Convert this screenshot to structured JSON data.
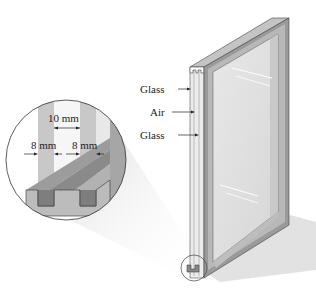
{
  "figure": {
    "labels": {
      "glass_top": "Glass",
      "air": "Air",
      "glass_bottom": "Glass",
      "gap": "10 mm",
      "pane_left": "8 mm",
      "pane_right": "8 mm"
    },
    "colors": {
      "frame_dark": "#7a7a7a",
      "frame_mid": "#a8a8a8",
      "frame_light": "#c8c8c8",
      "glass": "#e4e4e4",
      "shadow": "#d8d8d8",
      "outline": "#444444"
    }
  }
}
